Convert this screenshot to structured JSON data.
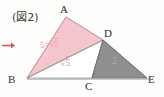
{
  "figure": {
    "caption": "(図2)",
    "type": "geometry-diagram",
    "background_color": "#fdfdfb"
  },
  "vertices": [
    {
      "id": "A",
      "label": "A",
      "x": 66,
      "y": 17
    },
    {
      "id": "B",
      "label": "B",
      "x": 27,
      "y": 78
    },
    {
      "id": "C",
      "label": "C",
      "x": 92,
      "y": 78
    },
    {
      "id": "D",
      "label": "D",
      "x": 103,
      "y": 40
    },
    {
      "id": "E",
      "label": "E",
      "x": 147,
      "y": 78
    }
  ],
  "regions": [
    {
      "name": "triangle-ABD",
      "fill_color": "#f6c6ce",
      "label": "S=√5",
      "label_color": "#e8a0ab"
    },
    {
      "name": "triangle-BDC",
      "fill_color": "#ffffff",
      "label": "√5",
      "label_color": "#e8939f"
    },
    {
      "name": "triangle-DCE",
      "fill_color": "#8f8f8f",
      "label": "2",
      "label_color": "#c8a0a6"
    }
  ],
  "labels": {
    "pink_area_top": "5=√5",
    "pink_area_top_prefix": "5=",
    "pink_area_top_radicand": "5",
    "pink_area_bottom_radicand": "5",
    "gray_area": "2"
  },
  "marker": {
    "name": "red-arrow",
    "color": "#d9545f",
    "direction": "right"
  },
  "colors": {
    "pink_fill": "#f6c6ce",
    "gray_fill": "#8f8f8f",
    "line": "#7a7a7a",
    "text": "#2e2e2e",
    "accent": "#d9545f"
  }
}
